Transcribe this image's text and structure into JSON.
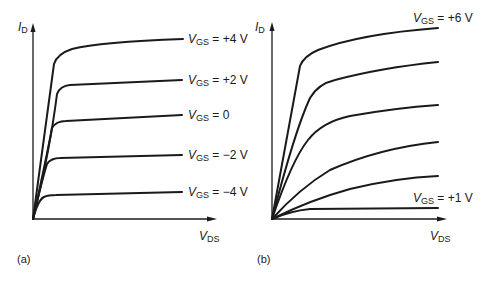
{
  "panels": [
    {
      "id": "a",
      "caption": "(a)",
      "y_axis": {
        "symbol": "I",
        "subscript": "D"
      },
      "x_axis": {
        "symbol": "V",
        "subscript": "DS"
      },
      "curves": [
        {
          "prefix": "V",
          "sub": "GS",
          "value": " = +4 V"
        },
        {
          "prefix": "V",
          "sub": "GS",
          "value": " = +2 V"
        },
        {
          "prefix": "V",
          "sub": "GS",
          "value": " = 0"
        },
        {
          "prefix": "V",
          "sub": "GS",
          "value": " = −2 V"
        },
        {
          "prefix": "V",
          "sub": "GS",
          "value": " = −4 V"
        }
      ]
    },
    {
      "id": "b",
      "caption": "(b)",
      "y_axis": {
        "symbol": "I",
        "subscript": "D"
      },
      "x_axis": {
        "symbol": "V",
        "subscript": "DS"
      },
      "curves": [
        {
          "prefix": "V",
          "sub": "GS",
          "value": " = +6 V"
        },
        {
          "prefix": "V",
          "sub": "GS",
          "value": " = +1 V"
        }
      ],
      "unlabeled_curve_count": 4
    }
  ],
  "colors": {
    "ink": "#1a1a1a",
    "background": "#ffffff"
  }
}
